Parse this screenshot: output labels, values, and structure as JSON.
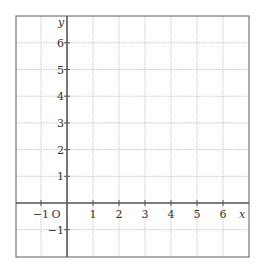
{
  "chart_data": {
    "type": "coordinate-grid",
    "xlabel": "x",
    "ylabel": "y",
    "origin_label": "O",
    "xlim": [
      -2,
      7
    ],
    "ylim": [
      -2,
      7
    ],
    "x_ticks": [
      -1,
      1,
      2,
      3,
      4,
      5,
      6
    ],
    "y_ticks": [
      -1,
      1,
      2,
      3,
      4,
      5,
      6
    ],
    "x_tick_labels": [
      "−1",
      "1",
      "2",
      "3",
      "4",
      "5",
      "6"
    ],
    "y_tick_labels": [
      "−1",
      "1",
      "2",
      "3",
      "4",
      "5",
      "6"
    ],
    "grid": true,
    "grid_style": "dotted",
    "colors": {
      "axis": "#555555",
      "grid": "#c8c8c8",
      "border": "#777777",
      "text": "#333333"
    }
  }
}
